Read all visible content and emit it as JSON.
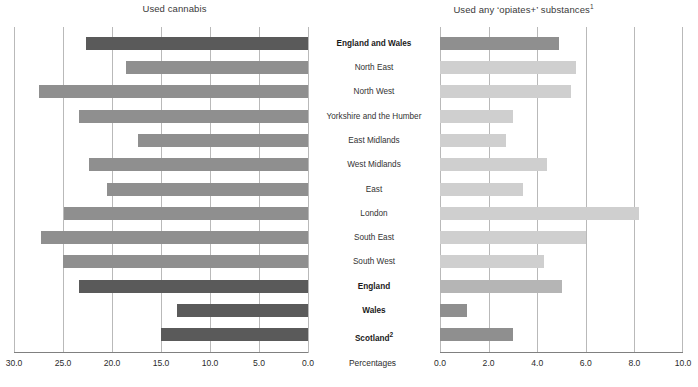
{
  "panels": {
    "left": {
      "title": "Used cannabis"
    },
    "right": {
      "title_main": "Used any ‘opiates+’ substances",
      "title_sup": "1"
    }
  },
  "axis_caption": "Percentages",
  "categories": [
    {
      "label": "England and Wales",
      "bold": true
    },
    {
      "label": "North East",
      "bold": false
    },
    {
      "label": "North West",
      "bold": false
    },
    {
      "label": "Yorkshire and the Humber",
      "bold": false
    },
    {
      "label": "East Midlands",
      "bold": false
    },
    {
      "label": "West Midlands",
      "bold": false
    },
    {
      "label": "East",
      "bold": false
    },
    {
      "label": "London",
      "bold": false
    },
    {
      "label": "South East",
      "bold": false
    },
    {
      "label": "South West",
      "bold": false
    },
    {
      "label": "England",
      "bold": true
    },
    {
      "label": "Wales",
      "bold": true
    },
    {
      "label": "Scotland",
      "bold": true,
      "sup": "2"
    }
  ],
  "left_ticks": [
    "30.0",
    "25.0",
    "20.0",
    "15.0",
    "10.0",
    "5.0",
    "0.0"
  ],
  "right_ticks": [
    "0.0",
    "2.0",
    "4.0",
    "6.0",
    "8.0",
    "10.0"
  ],
  "colors": {
    "bar_dark": "#5a5a5a",
    "bar_mid": "#8f8f8f",
    "bar_light": "#b5b5b5",
    "bar_pale": "#cfcfcf",
    "gridline": "#b9b9b9",
    "axis": "#808080"
  },
  "chart_data": [
    {
      "type": "bar",
      "title": "Used cannabis",
      "orientation": "horizontal-reversed",
      "xlabel": "Percentages",
      "ylabel": "",
      "xlim": [
        30.0,
        0.0
      ],
      "grid": true,
      "legend": "none",
      "categories": [
        "England and Wales",
        "North East",
        "North West",
        "Yorkshire and the Humber",
        "East Midlands",
        "West Midlands",
        "East",
        "London",
        "South East",
        "South West",
        "England",
        "Wales",
        "Scotland"
      ],
      "values": [
        22.7,
        18.6,
        27.4,
        23.4,
        17.3,
        22.3,
        20.5,
        24.9,
        27.2,
        25.0,
        23.4,
        13.4,
        15.0
      ],
      "bar_colors": [
        "#5a5a5a",
        "#8f8f8f",
        "#8f8f8f",
        "#8f8f8f",
        "#8f8f8f",
        "#8f8f8f",
        "#8f8f8f",
        "#8f8f8f",
        "#8f8f8f",
        "#8f8f8f",
        "#5a5a5a",
        "#5a5a5a",
        "#5a5a5a"
      ]
    },
    {
      "type": "bar",
      "title": "Used any ‘opiates+’ substances",
      "orientation": "horizontal",
      "xlabel": "Percentages",
      "ylabel": "",
      "xlim": [
        0.0,
        10.0
      ],
      "grid": true,
      "legend": "none",
      "categories": [
        "England and Wales",
        "North East",
        "North West",
        "Yorkshire and the Humber",
        "East Midlands",
        "West Midlands",
        "East",
        "London",
        "South East",
        "South West",
        "England",
        "Wales",
        "Scotland"
      ],
      "values": [
        4.9,
        5.6,
        5.4,
        3.0,
        2.7,
        4.4,
        3.4,
        8.2,
        6.0,
        4.3,
        5.0,
        1.1,
        3.0
      ],
      "bar_colors": [
        "#8f8f8f",
        "#cfcfcf",
        "#cfcfcf",
        "#cfcfcf",
        "#cfcfcf",
        "#cfcfcf",
        "#cfcfcf",
        "#cfcfcf",
        "#cfcfcf",
        "#cfcfcf",
        "#b5b5b5",
        "#8f8f8f",
        "#8f8f8f"
      ]
    }
  ]
}
